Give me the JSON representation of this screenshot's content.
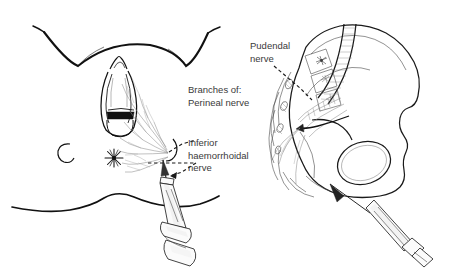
{
  "figure": {
    "type": "medical-illustration",
    "background_color": "#ffffff",
    "ink_color": "#111111",
    "nerve_color": "#8d8d8d",
    "text_color": "#3a3a3a"
  },
  "labels": {
    "branches_line1": "Branches of:",
    "branches_line2": "Perineal nerve",
    "inferior_line1": "Inferior",
    "inferior_line2": "haemorrhoidal",
    "inferior_line3": "nerve",
    "pudendal_line1": "Pudendal",
    "pudendal_line2": "nerve"
  },
  "left_panel": {
    "name": "perineal-view",
    "parts": [
      "mons-pubis-arch",
      "inguinal-fold-left",
      "inguinal-fold-right",
      "vulva",
      "vaginal-introitus",
      "anus",
      "skin-mark",
      "gluteal-fold",
      "perineal-nerve-branches",
      "inferior-haemorrhoidal-branches",
      "syringe"
    ]
  },
  "right_panel": {
    "name": "pelvic-bone-view",
    "parts": [
      "innominate-bone",
      "iliac-crest",
      "obturator-foramen",
      "sacrum",
      "lumbar-spine",
      "sacral-foramina",
      "sacral-plexus",
      "pudendal-nerve-trunk",
      "ischial-spine",
      "sacrospinous-ligament",
      "syringe"
    ]
  }
}
